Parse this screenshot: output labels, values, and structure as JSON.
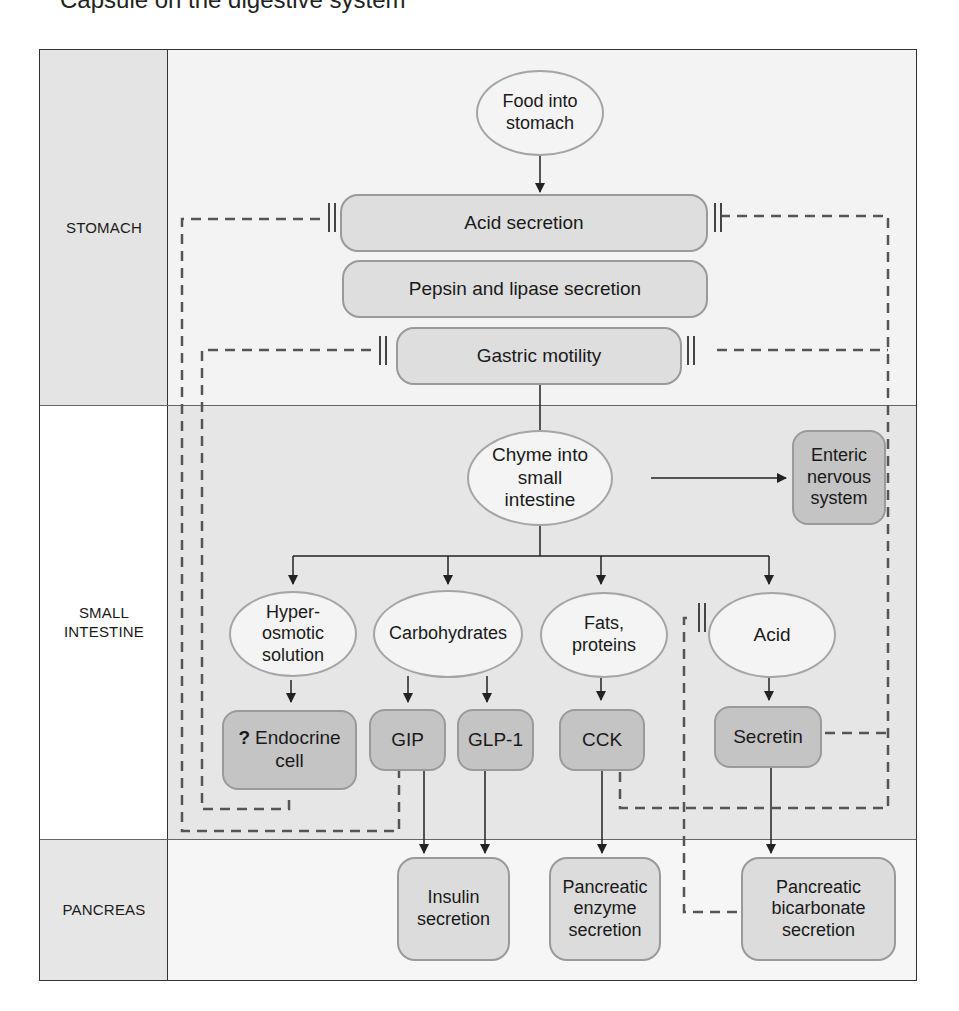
{
  "header": {
    "clipped_title": "Capsule on the digestive system"
  },
  "regions": [
    {
      "id": "stomach",
      "label": "STOMACH",
      "label_bg": "#e4e4e4",
      "main_bg": "#f3f3f3"
    },
    {
      "id": "small_intestine",
      "label": "SMALL\nINTESTINE",
      "label_bg": "#ffffff",
      "main_bg": "#e6e6e6"
    },
    {
      "id": "pancreas",
      "label": "PANCREAS",
      "label_bg": "#e6e6e6",
      "main_bg": "#f6f6f6"
    }
  ],
  "nodes": {
    "food": "Food into stomach",
    "acid_secretion": "Acid secretion",
    "pepsin": "Pepsin and lipase secretion",
    "gastric_motility": "Gastric motility",
    "chyme": "Chyme into small intestine",
    "ens": "Enteric nervous system",
    "hyperosmotic": "Hyper-osmotic solution",
    "carbohydrates": "Carbohydrates",
    "fats": "Fats, proteins",
    "acid": "Acid",
    "endocrine_q": "?",
    "endocrine": "Endocrine cell",
    "gip": "GIP",
    "glp1": "GLP-1",
    "cck": "CCK",
    "secretin": "Secretin",
    "insulin": "Insulin secretion",
    "enzyme": "Pancreatic enzyme secretion",
    "bicarbonate": "Pancreatic bicarbonate secretion"
  },
  "legend": {
    "solid_arrow": "stimulates / leads to",
    "dashed_inhibit": "inhibitory feedback (||)"
  },
  "colors": {
    "stomach_box": "#dedede",
    "hormone_box": "#c4c4c4",
    "ellipse": "#f4f4f4",
    "line": "#222222",
    "dashed": "#555555"
  }
}
